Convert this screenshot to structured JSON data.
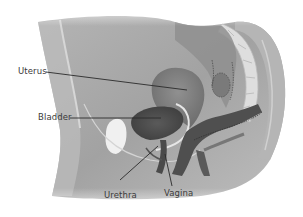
{
  "diagram": {
    "labels": {
      "uterus": "Uterus",
      "bladder": "Bladder",
      "urethra": "Urethra",
      "vagina": "Vagina"
    },
    "colors": {
      "background": "#ffffff",
      "body": "#a9a9a9",
      "body_light": "#c8c8c8",
      "organ_mid": "#808080",
      "organ_dark": "#505050",
      "spine": "#dcdcdc",
      "leader_line": "#2a2a2a",
      "label_text": "#3a3a3a"
    }
  }
}
